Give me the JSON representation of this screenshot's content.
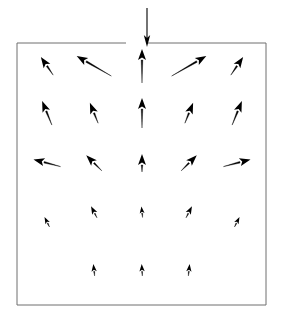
{
  "figure": {
    "title": "",
    "domain_type": "vector-field-diagram",
    "canvas": {
      "width": 283,
      "height": 322
    },
    "background_color": "#ffffff",
    "ink_color": "#000000"
  },
  "boundary_box": {
    "name": "domain-boundary",
    "x": 17,
    "y": 43,
    "width": 249,
    "height": 262,
    "stroke_color": "#6e6e6e",
    "stroke_width": 1,
    "fill": "none",
    "gap_top_center": true,
    "gap_x_start": 126,
    "gap_x_end": 147
  },
  "inlet_jet": {
    "name": "inlet-jet-arrow",
    "x": 147,
    "y_start": 8,
    "y_end": 43,
    "direction": "down",
    "label": ""
  },
  "chart_data": {
    "type": "quiver",
    "title": "",
    "xlabel": "",
    "ylabel": "",
    "grid": false,
    "legend": null,
    "xlim": [
      17,
      266
    ],
    "ylim": [
      43,
      305
    ],
    "columns_x": [
      47,
      94,
      142,
      189,
      237
    ],
    "rows_y": [
      66,
      113,
      163,
      214,
      264
    ],
    "vectors": [
      {
        "row": 1,
        "col": 1,
        "x": 47,
        "y": 66,
        "u": -0.42,
        "v": -0.62,
        "angle_deg": 236,
        "length": 22,
        "head": "solid"
      },
      {
        "row": 1,
        "col": 2,
        "x": 94,
        "y": 66,
        "u": -0.88,
        "v": -0.5,
        "angle_deg": 210,
        "length": 40,
        "head": "solid"
      },
      {
        "row": 1,
        "col": 3,
        "x": 142,
        "y": 66,
        "u": 0.0,
        "v": -1.0,
        "angle_deg": 270,
        "length": 34,
        "head": "solid"
      },
      {
        "row": 1,
        "col": 4,
        "x": 189,
        "y": 66,
        "u": 0.88,
        "v": -0.5,
        "angle_deg": 330,
        "length": 40,
        "head": "solid"
      },
      {
        "row": 1,
        "col": 5,
        "x": 237,
        "y": 66,
        "u": 0.42,
        "v": -0.62,
        "angle_deg": 304,
        "length": 22,
        "head": "solid"
      },
      {
        "row": 2,
        "col": 1,
        "x": 47,
        "y": 113,
        "u": -0.38,
        "v": -0.92,
        "angle_deg": 248,
        "length": 26,
        "head": "solid"
      },
      {
        "row": 2,
        "col": 2,
        "x": 94,
        "y": 113,
        "u": -0.38,
        "v": -0.92,
        "angle_deg": 248,
        "length": 22,
        "head": "solid"
      },
      {
        "row": 2,
        "col": 3,
        "x": 142,
        "y": 113,
        "u": 0.0,
        "v": -1.0,
        "angle_deg": 270,
        "length": 30,
        "head": "solid"
      },
      {
        "row": 2,
        "col": 4,
        "x": 189,
        "y": 113,
        "u": 0.38,
        "v": -0.92,
        "angle_deg": 292,
        "length": 22,
        "head": "solid"
      },
      {
        "row": 2,
        "col": 5,
        "x": 237,
        "y": 113,
        "u": 0.38,
        "v": -0.92,
        "angle_deg": 292,
        "length": 26,
        "head": "solid"
      },
      {
        "row": 3,
        "col": 1,
        "x": 47,
        "y": 163,
        "u": -0.97,
        "v": -0.25,
        "angle_deg": 195,
        "length": 28,
        "head": "solid"
      },
      {
        "row": 3,
        "col": 2,
        "x": 94,
        "y": 163,
        "u": -0.7,
        "v": -0.7,
        "angle_deg": 225,
        "length": 22,
        "head": "solid"
      },
      {
        "row": 3,
        "col": 3,
        "x": 142,
        "y": 163,
        "u": 0.0,
        "v": -1.0,
        "angle_deg": 270,
        "length": 18,
        "head": "solid"
      },
      {
        "row": 3,
        "col": 4,
        "x": 189,
        "y": 163,
        "u": 0.7,
        "v": -0.7,
        "angle_deg": 315,
        "length": 22,
        "head": "solid"
      },
      {
        "row": 3,
        "col": 5,
        "x": 237,
        "y": 163,
        "u": 0.97,
        "v": -0.25,
        "angle_deg": 345,
        "length": 28,
        "head": "solid"
      },
      {
        "row": 4,
        "col": 1,
        "x": 47,
        "y": 222,
        "u": -0.45,
        "v": -0.89,
        "angle_deg": 243,
        "length": 11,
        "head": "solid"
      },
      {
        "row": 4,
        "col": 2,
        "x": 94,
        "y": 212,
        "u": -0.45,
        "v": -0.89,
        "angle_deg": 243,
        "length": 13,
        "head": "solid"
      },
      {
        "row": 4,
        "col": 3,
        "x": 142,
        "y": 212,
        "u": -0.1,
        "v": -0.99,
        "angle_deg": 264,
        "length": 11,
        "head": "solid"
      },
      {
        "row": 4,
        "col": 4,
        "x": 189,
        "y": 212,
        "u": 0.45,
        "v": -0.89,
        "angle_deg": 297,
        "length": 13,
        "head": "solid"
      },
      {
        "row": 4,
        "col": 5,
        "x": 237,
        "y": 222,
        "u": 0.45,
        "v": -0.89,
        "angle_deg": 297,
        "length": 11,
        "head": "solid"
      },
      {
        "row": 5,
        "col": 2,
        "x": 94,
        "y": 270,
        "u": -0.1,
        "v": -0.99,
        "angle_deg": 264,
        "length": 12,
        "head": "solid"
      },
      {
        "row": 5,
        "col": 3,
        "x": 142,
        "y": 270,
        "u": -0.05,
        "v": -1.0,
        "angle_deg": 267,
        "length": 12,
        "head": "solid"
      },
      {
        "row": 5,
        "col": 4,
        "x": 189,
        "y": 270,
        "u": 0.1,
        "v": -0.99,
        "angle_deg": 276,
        "length": 12,
        "head": "solid"
      }
    ]
  }
}
